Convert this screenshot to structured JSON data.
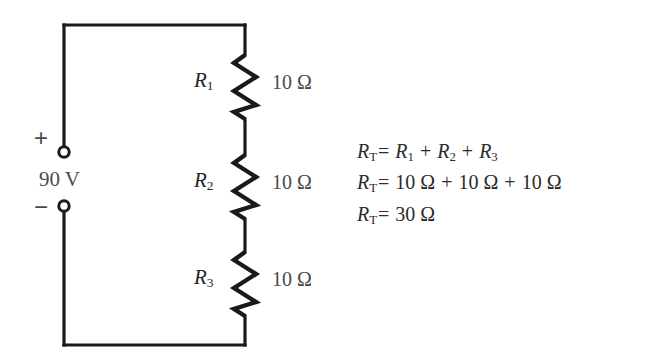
{
  "diagram": {
    "background_color": "#ffffff",
    "wire_color": "#1a1a1a",
    "text_color": "#3a3a3a"
  },
  "source": {
    "label": "90 V",
    "positive_sign": "+",
    "negative_sign": "−",
    "positive_terminal_name": "positive-terminal",
    "negative_terminal_name": "negative-terminal"
  },
  "resistors": [
    {
      "name": "R",
      "subscript": "1",
      "value": "10 Ω"
    },
    {
      "name": "R",
      "subscript": "2",
      "value": "10 Ω"
    },
    {
      "name": "R",
      "subscript": "3",
      "value": "10 Ω"
    }
  ],
  "equations": {
    "line1": {
      "lhs_symbol": "R",
      "lhs_sub": "T",
      "eq": "=",
      "term1_symbol": "R",
      "term1_sub": "1",
      "op1": "+",
      "term2_symbol": "R",
      "term2_sub": "2",
      "op2": "+",
      "term3_symbol": "R",
      "term3_sub": "3"
    },
    "line2": {
      "lhs_symbol": "R",
      "lhs_sub": "T",
      "eq": "=",
      "term1": "10 Ω",
      "op1": "+",
      "term2": "10 Ω",
      "op2": "+",
      "term3": "10 Ω"
    },
    "line3": {
      "lhs_symbol": "R",
      "lhs_sub": "T",
      "eq": "=",
      "result": "30 Ω"
    }
  }
}
